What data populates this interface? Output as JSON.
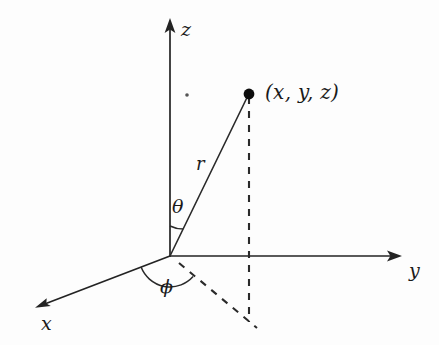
{
  "figure": {
    "background_color": "#fdfdfd",
    "stroke_color": "#232323",
    "axes": [
      {
        "key": "z",
        "label": "z",
        "from": [
          170,
          256
        ],
        "to": [
          170,
          20
        ],
        "label_pos": [
          181,
          20
        ]
      },
      {
        "key": "y",
        "label": "y",
        "from": [
          170,
          256
        ],
        "to": [
          400,
          256
        ],
        "label_pos": [
          409,
          261
        ]
      },
      {
        "key": "x",
        "label": "x",
        "from": [
          170,
          256
        ],
        "to": [
          37,
          307
        ],
        "label_pos": [
          41,
          314
        ]
      }
    ],
    "point": {
      "label": "(x, y, z)",
      "pos": [
        249,
        94
      ],
      "radius": 5.2,
      "label_pos": [
        265,
        82
      ]
    },
    "radius_ray": {
      "label": "r",
      "from": [
        170,
        256
      ],
      "to": [
        249,
        94
      ],
      "label_pos": [
        196,
        155
      ]
    },
    "angles": [
      {
        "key": "theta",
        "label": "θ",
        "label_pos": [
          172,
          197
        ],
        "arc_radius": 30,
        "arc_start_deg": 90,
        "arc_end_deg": 64
      },
      {
        "key": "phi",
        "label": "ϕ",
        "label_pos": [
          160,
          277
        ],
        "arc_radius": 31,
        "arc_start_deg": 201,
        "arc_end_deg": 318
      }
    ],
    "dashed_segments": [
      {
        "key": "vertical-drop",
        "from": [
          249,
          94
        ],
        "to": [
          249,
          322
        ]
      },
      {
        "key": "xy-projection",
        "from": [
          178,
          262
        ],
        "to": [
          257,
          328
        ]
      }
    ],
    "speck": {
      "key": "ink-speck",
      "pos": [
        187,
        95
      ],
      "radius": 1.8
    }
  }
}
